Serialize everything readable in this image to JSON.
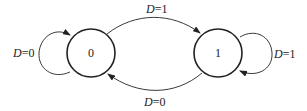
{
  "diagram": {
    "type": "state-transition",
    "states": [
      {
        "id": "s0",
        "label": "0"
      },
      {
        "id": "s1",
        "label": "1"
      }
    ],
    "transitions": [
      {
        "from": "0",
        "to": "0",
        "var": "D",
        "eq": "=",
        "value": "0",
        "kind": "self-loop-left"
      },
      {
        "from": "0",
        "to": "1",
        "var": "D",
        "eq": "=",
        "value": "1",
        "kind": "arc-top"
      },
      {
        "from": "1",
        "to": "1",
        "var": "D",
        "eq": "=",
        "value": "1",
        "kind": "self-loop-right"
      },
      {
        "from": "1",
        "to": "0",
        "var": "D",
        "eq": "=",
        "value": "0",
        "kind": "arc-bottom"
      }
    ],
    "colors": {
      "stroke": "#222222",
      "background": "#ffffff"
    }
  }
}
